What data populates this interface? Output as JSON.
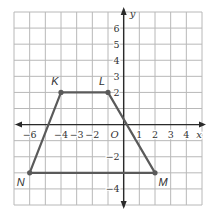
{
  "diagram": {
    "type": "coordinate-plane",
    "x_range": [
      -7,
      5
    ],
    "y_range": [
      -5,
      7
    ],
    "axis_labels": {
      "x": "x",
      "y": "y",
      "origin": "O"
    },
    "x_tick_labels": [
      {
        "value": -6,
        "label": "−6"
      },
      {
        "value": -4,
        "label": "−4"
      },
      {
        "value": -3,
        "label": "−3"
      },
      {
        "value": -2,
        "label": "−2"
      },
      {
        "value": 1,
        "label": "1"
      },
      {
        "value": 2,
        "label": "2"
      },
      {
        "value": 3,
        "label": "3"
      },
      {
        "value": 4,
        "label": "4"
      }
    ],
    "y_tick_labels": [
      {
        "value": 6,
        "label": "6"
      },
      {
        "value": 5,
        "label": "5"
      },
      {
        "value": 4,
        "label": "4"
      },
      {
        "value": 3,
        "label": "3"
      },
      {
        "value": 2,
        "label": "2"
      },
      {
        "value": -2,
        "label": "−2"
      },
      {
        "value": -4,
        "label": "−4"
      }
    ],
    "polygon": {
      "name": "KLMN",
      "vertices": [
        {
          "label": "K",
          "x": -4,
          "y": 2
        },
        {
          "label": "L",
          "x": -1,
          "y": 2
        },
        {
          "label": "M",
          "x": 2,
          "y": -3
        },
        {
          "label": "N",
          "x": -6,
          "y": -3
        }
      ]
    },
    "colors": {
      "grid": "#b8b8b8",
      "axis": "#2a2a2a",
      "shape": "#5a5a5a"
    }
  }
}
